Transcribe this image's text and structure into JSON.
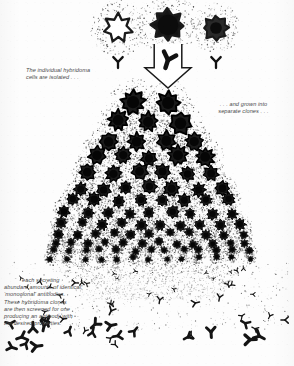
{
  "figure": {
    "background_color": "#fdfdfd",
    "ink_color": "#111111",
    "caption_color": "#4a4a4a"
  },
  "captions": {
    "isolated": "The individual hybridoma\ncells are isolated . . .",
    "clones": ". . . and grown into\nseparate clones . . .",
    "secreting_first_line": "each secreting",
    "secreting_rest": "abundant amounts of identical,\n‘monoclonal’ antibodies.\nThese hybridoma clones\nare then screened for one\nproducing an antibody with\nthe desired properties."
  },
  "top_cells": [
    {
      "label": "hybridoma-cell-left",
      "cx": 118,
      "cy": 28,
      "r": 14.5,
      "fill": "#ffffff",
      "core": 0.0,
      "halo": 1.0
    },
    {
      "label": "hybridoma-cell-middle",
      "cx": 168,
      "cy": 25,
      "r": 16.5,
      "fill": "#141414",
      "core": 0.62,
      "halo": 1.0
    },
    {
      "label": "hybridoma-cell-right",
      "cx": 216,
      "cy": 28,
      "r": 13.0,
      "fill": "#2a2a2a",
      "core": 0.45,
      "halo": 1.0
    }
  ],
  "top_antibodies": [
    {
      "label": "antibody-left",
      "x": 118,
      "y": 62,
      "size": 11,
      "rot": 0,
      "bold": false
    },
    {
      "label": "antibody-right",
      "x": 216,
      "y": 62,
      "size": 11,
      "rot": 0,
      "bold": false
    },
    {
      "label": "antibody-in-arrow",
      "x": 168,
      "y": 60,
      "size": 15,
      "rot": 18,
      "bold": true
    }
  ],
  "arrow": {
    "label": "down-arrow",
    "x": 168,
    "y": 44,
    "width": 46,
    "height": 44,
    "stroke": "#1a1a1a",
    "fill": "#ffffff"
  },
  "colony": {
    "label": "clonal-colony",
    "apex_x": 150,
    "apex_y": 96,
    "base_y": 262,
    "rows": [
      {
        "y": 104,
        "count": 2,
        "r": 11.5,
        "spread": 34
      },
      {
        "y": 122,
        "count": 3,
        "r": 10.8,
        "spread": 62
      },
      {
        "y": 140,
        "count": 4,
        "r": 10.0,
        "spread": 86
      },
      {
        "y": 157,
        "count": 5,
        "r": 9.2,
        "spread": 108
      },
      {
        "y": 173,
        "count": 6,
        "r": 8.4,
        "spread": 126
      },
      {
        "y": 188,
        "count": 7,
        "r": 7.6,
        "spread": 142
      },
      {
        "y": 201,
        "count": 8,
        "r": 6.9,
        "spread": 156
      },
      {
        "y": 213,
        "count": 9,
        "r": 6.2,
        "spread": 168
      },
      {
        "y": 224,
        "count": 10,
        "r": 5.6,
        "spread": 178
      },
      {
        "y": 234,
        "count": 11,
        "r": 5.0,
        "spread": 186
      },
      {
        "y": 243,
        "count": 12,
        "r": 4.5,
        "spread": 192
      },
      {
        "y": 251,
        "count": 13,
        "r": 4.0,
        "spread": 196
      },
      {
        "y": 258,
        "count": 13,
        "r": 3.5,
        "spread": 198
      }
    ],
    "cell_fill": "#1b1b1b",
    "cell_ring": "#000000"
  },
  "secreted_antibodies_region": {
    "label": "secreted-antibodies",
    "top": 268,
    "bottom": 352,
    "left": 6,
    "right": 290,
    "count": 58,
    "color": "#141414"
  },
  "stipple": {
    "label": "stipple-halo",
    "color": "#3a3a3a",
    "density": "high"
  }
}
